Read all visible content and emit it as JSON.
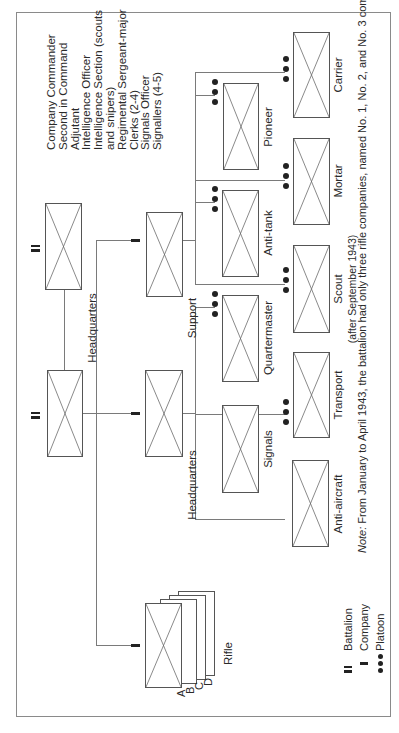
{
  "diagram": {
    "orientation": "rotated 90 degrees counter-clockwise",
    "battalion": {
      "label": "",
      "symbol": "battalion"
    },
    "battalion_hq": {
      "label": "Headquarters",
      "symbol": "battalion",
      "staff": [
        "Company Commander",
        "Second in Command",
        "Adjutant",
        "Intelligence Officer",
        "Intelligence Section (scouts and snipers)",
        "Regimental Sergeant-major",
        "Clerks (2-4)",
        "Signals Officer",
        "Signallers (4-5)"
      ]
    },
    "rifle_companies": {
      "label": "Rifle",
      "symbol": "company",
      "letters": [
        "A",
        "B",
        "C",
        "D"
      ]
    },
    "hq_company": {
      "label": "Headquarters",
      "symbol": "company",
      "platoons": [
        {
          "label": "Anti-aircraft",
          "symbol": "platoon"
        },
        {
          "label": "Signals",
          "symbol": "platoon"
        },
        {
          "label": "Transport",
          "symbol": "platoon"
        },
        {
          "label": "Quartermaster",
          "symbol": "platoon"
        }
      ]
    },
    "support_company": {
      "label": "Support",
      "symbol": "company",
      "platoons": [
        {
          "label": "Scout",
          "sublabel": "(after September 1943)",
          "symbol": "platoon"
        },
        {
          "label": "Anti-tank",
          "symbol": "platoon"
        },
        {
          "label": "Mortar",
          "symbol": "platoon"
        },
        {
          "label": "Pioneer",
          "symbol": "platoon"
        },
        {
          "label": "Carrier",
          "symbol": "platoon"
        }
      ]
    },
    "legend": [
      {
        "symbol": "battalion",
        "label": "Battalion"
      },
      {
        "symbol": "company",
        "label": "Company"
      },
      {
        "symbol": "platoon",
        "label": "Platoon"
      }
    ],
    "note": {
      "prefix": "Note:",
      "text": " From January to April 1943, the battalion had only three rifle companies, named No. 1, No. 2, and No. 3 companies."
    },
    "colors": {
      "line": "#7a7a7a",
      "box": "#555555",
      "symbol": "#222222",
      "background": "#ffffff"
    }
  }
}
